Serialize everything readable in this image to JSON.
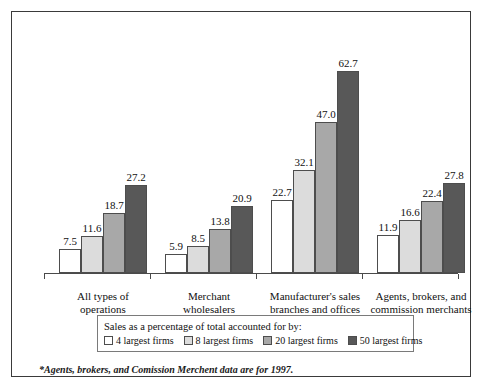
{
  "chart_data": {
    "type": "bar",
    "title": "",
    "subtitle": "",
    "xlabel": "",
    "ylabel": "",
    "ylim": [
      0,
      70
    ],
    "grid": false,
    "legend_position": "bottom",
    "legend_title": "Sales as a percentage of total accounted for by:",
    "categories": [
      "All types of operations",
      "Merchant wholesalers",
      "Manufacturer's sales branches and offices",
      "Agents, brokers, and commission merchants"
    ],
    "category_lines": [
      [
        "All types of",
        "operations"
      ],
      [
        "Merchant",
        "wholesalers"
      ],
      [
        "Manufacturer's sales",
        "branches and offices"
      ],
      [
        "Agents, brokers, and",
        "commission merchants"
      ]
    ],
    "series": [
      {
        "name": "4 largest firms",
        "color": "#ffffff",
        "values": [
          7.5,
          5.9,
          22.7,
          11.9
        ]
      },
      {
        "name": "8 largest firms",
        "color": "#dcdcdc",
        "values": [
          11.6,
          8.5,
          32.1,
          16.6
        ]
      },
      {
        "name": "20 largest firms",
        "color": "#a8a8a8",
        "values": [
          18.7,
          13.8,
          47.0,
          22.4
        ]
      },
      {
        "name": "50 largest firms",
        "color": "#585858",
        "values": [
          27.2,
          20.9,
          62.7,
          27.8
        ]
      }
    ],
    "value_labels": [
      [
        "7.5",
        "11.6",
        "18.7",
        "27.2"
      ],
      [
        "5.9",
        "8.5",
        "13.8",
        "20.9"
      ],
      [
        "22.7",
        "32.1",
        "47.0",
        "62.7"
      ],
      [
        "11.9",
        "16.6",
        "22.4",
        "27.8"
      ]
    ],
    "annotations": [
      "*Agents, brokers, and Comission Merchent data are for 1997."
    ]
  },
  "footnote": "*Agents, brokers, and Comission Merchent data are for 1997.",
  "colors": {
    "series1": "#ffffff",
    "series2": "#dcdcdc",
    "series3": "#a8a8a8",
    "series4": "#585858",
    "frame": "#3a3a3a",
    "axis": "#4a4a4a",
    "text": "#111111"
  }
}
